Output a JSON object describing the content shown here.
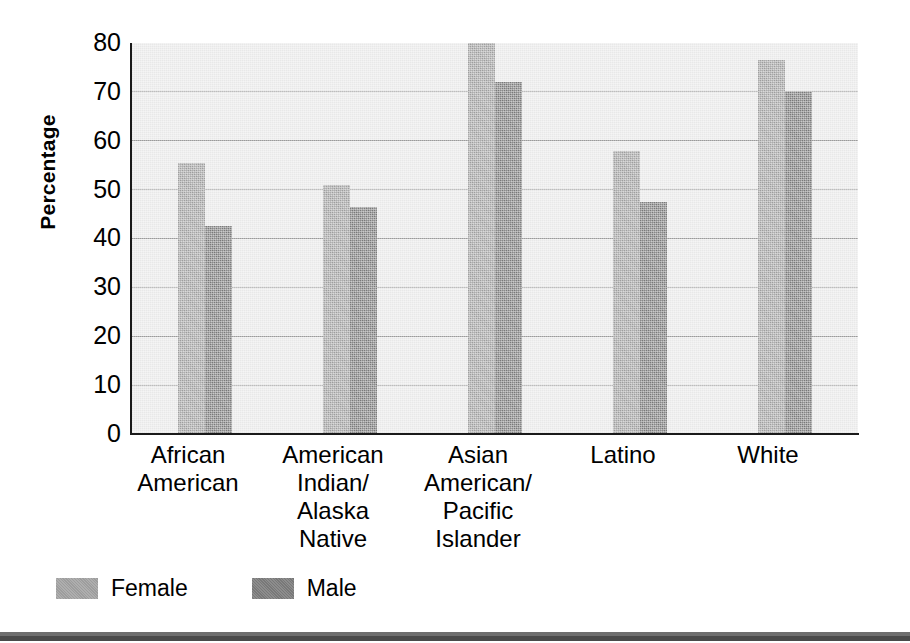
{
  "chart_data": {
    "type": "bar",
    "title": "",
    "xlabel": "",
    "ylabel": "Percentage",
    "ylim": [
      0,
      80
    ],
    "yticks": [
      80,
      70,
      60,
      50,
      40,
      30,
      20,
      10,
      0
    ],
    "grid": true,
    "legend_position": "bottom-left",
    "categories": [
      "African American",
      "American Indian/ Alaska Native",
      "Asian American/ Pacific Islander",
      "Latino",
      "White"
    ],
    "category_lines": [
      [
        "African",
        "American"
      ],
      [
        "American",
        "Indian/",
        "Alaska",
        "Native"
      ],
      [
        "Asian",
        "American/",
        "Pacific",
        "Islander"
      ],
      [
        "Latino"
      ],
      [
        "White"
      ]
    ],
    "series": [
      {
        "name": "Female",
        "color": "#a3a3a3",
        "values": [
          55.5,
          51.0,
          80.0,
          58.0,
          76.5
        ]
      },
      {
        "name": "Male",
        "color": "#7d7d7d",
        "values": [
          42.5,
          46.5,
          72.0,
          47.5,
          70.0
        ]
      }
    ]
  },
  "legend": {
    "items": [
      {
        "label": "Female",
        "color": "#a3a3a3"
      },
      {
        "label": "Male",
        "color": "#7d7d7d"
      }
    ]
  },
  "axis": {
    "y_title": "Percentage",
    "tick_labels": [
      "80",
      "70",
      "60",
      "50",
      "40",
      "30",
      "20",
      "10",
      "0"
    ]
  },
  "colors": {
    "plot_background": "#e8e8e8",
    "gridline": "#9a9a9a",
    "axis_line": "#1a1a1a",
    "female_bar": "#a3a3a3",
    "male_bar": "#7d7d7d",
    "bottom_rule": "#4a4a4a"
  }
}
